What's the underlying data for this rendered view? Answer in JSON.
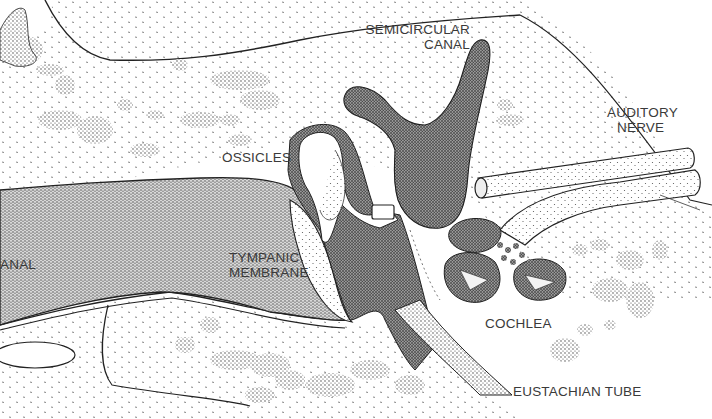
{
  "diagram": {
    "style": "stippled pen-and-ink illustration",
    "colors": {
      "background": "#ffffff",
      "ink": "#1e1e1e",
      "label_text": "#3a3a3a",
      "stipple_light": "#6a6a6a",
      "stipple_dark": "#262626"
    },
    "labels": [
      {
        "id": "semicircular-canal",
        "lines": [
          "SEMICIRCULAR",
          "CANAL"
        ],
        "x": 358,
        "y": 22
      },
      {
        "id": "auditory-nerve",
        "lines": [
          "AUDITORY",
          "NERVE"
        ],
        "x": 607,
        "y": 105
      },
      {
        "id": "ossicles",
        "lines": [
          "OSSICLES"
        ],
        "x": 222,
        "y": 148
      },
      {
        "id": "ear-canal",
        "lines": [
          "ANAL"
        ],
        "x": 0,
        "y": 257
      },
      {
        "id": "tympanic-membrane",
        "lines": [
          "TYMPANIC",
          "MEMBRANE"
        ],
        "x": 229,
        "y": 250
      },
      {
        "id": "cochlea",
        "lines": [
          "COCHLEA"
        ],
        "x": 485,
        "y": 316
      },
      {
        "id": "eustachian-tube",
        "lines": [
          "EUSTACHIAN TUBE"
        ],
        "x": 513,
        "y": 384
      }
    ],
    "structures": [
      "outer ear (top-left cartilage)",
      "ear canal",
      "tympanic membrane",
      "ossicles",
      "semicircular canal",
      "auditory nerve",
      "cochlea",
      "eustachian tube",
      "temporal bone"
    ]
  }
}
